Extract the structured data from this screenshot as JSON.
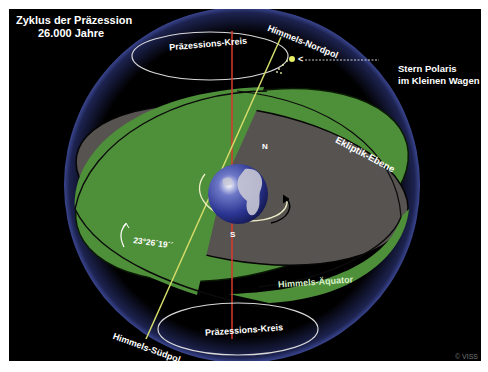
{
  "title": {
    "line1": "Zyklus der Präzession",
    "line2": "26.000 Jahre"
  },
  "labels": {
    "north_pole": "Himmels-Nordpol",
    "south_pole": "Himmels-Südpol",
    "precession_circle_top": "Präzessions-Kreis",
    "precession_circle_bottom": "Präzessions-Kreis",
    "polaris_line1": "Stern Polaris",
    "polaris_line2": "im Kleinen Wagen",
    "ecliptic_plane": "Ekliptik-Ebene",
    "celestial_equator": "Himmels-Äquator",
    "north_marker": "N",
    "south_marker": "S",
    "tilt_angle": "23°26´19´´",
    "polaris_arrow": "<"
  },
  "copyright": "© VISS",
  "colors": {
    "background": "#000000",
    "equator_plane": "#4e8f3a",
    "ecliptic_plane": "#575350",
    "celestial_sphere_edge": "#2b3570",
    "earth_axis": "#d4dc6a",
    "ecliptic_axis": "#d93a2e",
    "text": "#ffffff",
    "equator_label": "#d9f0c8"
  }
}
